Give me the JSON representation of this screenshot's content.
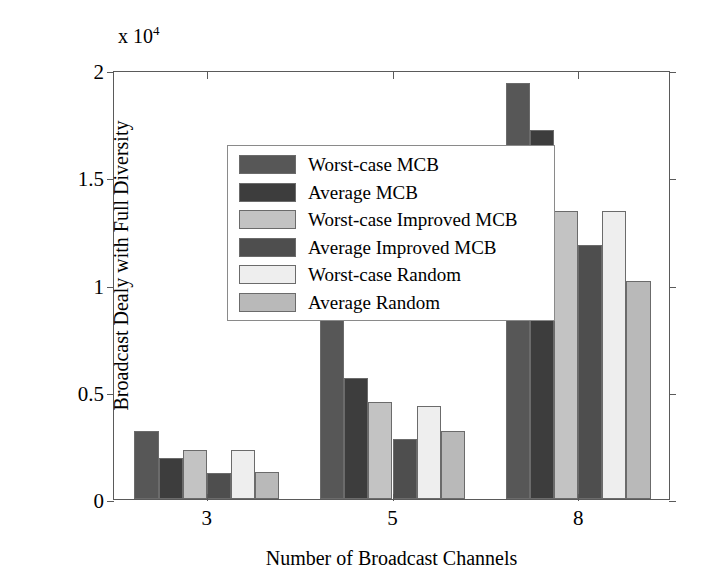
{
  "chart_data": {
    "type": "bar",
    "title": "",
    "xlabel": "Number of Broadcast Channels",
    "ylabel": "Broadcast Dealy with Full Diversity",
    "y_multiplier_text": "x 10",
    "y_multiplier_exponent": "4",
    "categories": [
      "3",
      "5",
      "8"
    ],
    "xtick_labels": [
      "3",
      "5",
      "8"
    ],
    "ytick_labels": [
      "0",
      "0.5",
      "1",
      "1.5",
      "2"
    ],
    "ytick_values": [
      0,
      5000,
      10000,
      15000,
      20000
    ],
    "ylim": [
      0,
      20000
    ],
    "grid": false,
    "legend_position": "upper-left-inside",
    "series": [
      {
        "name": "Worst-case MCB",
        "color": "#575757",
        "values": [
          3150,
          10800,
          19400
        ]
      },
      {
        "name": "Average MCB",
        "color": "#3d3d3d",
        "values": [
          1900,
          5640,
          17200
        ]
      },
      {
        "name": "Worst-case Improved MCB",
        "color": "#c3c3c3",
        "values": [
          2280,
          4520,
          13450
        ]
      },
      {
        "name": "Average Improved MCB",
        "color": "#4e4e4e",
        "values": [
          1210,
          2800,
          11830
        ]
      },
      {
        "name": "Worst-case Random",
        "color": "#eeeeee",
        "values": [
          2280,
          4340,
          13450
        ]
      },
      {
        "name": "Average Random",
        "color": "#b9b9b9",
        "values": [
          1260,
          3170,
          10170
        ]
      }
    ]
  },
  "legend": {
    "items": [
      {
        "label": "Worst-case MCB"
      },
      {
        "label": "Average MCB"
      },
      {
        "label": "Worst-case Improved MCB"
      },
      {
        "label": "Average Improved MCB"
      },
      {
        "label": "Worst-case Random"
      },
      {
        "label": "Average Random"
      }
    ]
  }
}
